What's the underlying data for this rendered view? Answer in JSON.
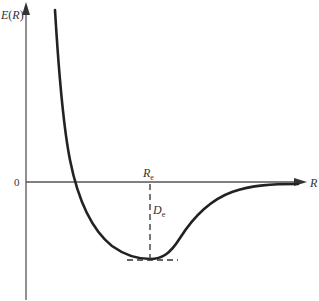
{
  "diagram": {
    "y_axis": {
      "label_main": "E",
      "label_open": "(",
      "label_var": "R",
      "label_close": ")"
    },
    "x_axis": {
      "label": "R"
    },
    "zero_label": "0",
    "equilibrium": {
      "label_main": "R",
      "label_sub": "e"
    },
    "dissociation": {
      "label_main": "D",
      "label_sub": "e"
    },
    "colors": {
      "axis": "#555555",
      "curve": "#222222",
      "dashed": "#333333",
      "text": "#333333"
    }
  }
}
